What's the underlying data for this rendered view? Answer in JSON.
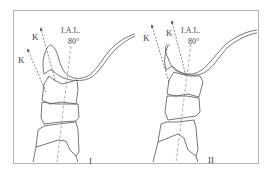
{
  "figure": {
    "colors": {
      "frame": "#b5b5b5",
      "outline": "#555555",
      "axis_dash": "#8a8a8a",
      "arrow": "#555555",
      "text": "#444444"
    },
    "panels": [
      {
        "id": "I",
        "panel_label": "I",
        "axis_label_line1": "I.A.L.",
        "axis_label_line2": "80°",
        "arrow_labels": [
          "K",
          "K"
        ]
      },
      {
        "id": "II",
        "panel_label": "II",
        "axis_label_line1": "I.A.L.",
        "axis_label_line2": "80°",
        "arrow_labels": [
          "K",
          "K"
        ]
      }
    ]
  }
}
